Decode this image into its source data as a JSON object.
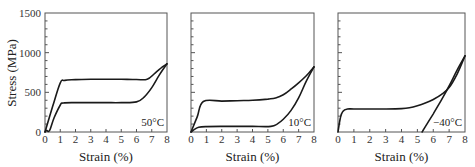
{
  "chart_data": [
    {
      "type": "line",
      "title": "",
      "annotation": "50°C",
      "xlabel": "Strain (%)",
      "ylabel": "Stress (MPa)",
      "xlim": [
        0,
        8
      ],
      "ylim": [
        0,
        1500
      ],
      "xticks": [
        0,
        1,
        2,
        3,
        4,
        5,
        6,
        7,
        8
      ],
      "yticks": [
        0,
        500,
        1000,
        1500
      ],
      "grid": false,
      "series": [
        {
          "name": "loading",
          "x": [
            0,
            0.5,
            1.0,
            1.3,
            2,
            3,
            4,
            5,
            6,
            6.7,
            7.2,
            7.7,
            8.0
          ],
          "y": [
            0,
            320,
            620,
            650,
            660,
            665,
            665,
            665,
            662,
            665,
            740,
            820,
            860
          ]
        },
        {
          "name": "unloading",
          "x": [
            8.0,
            7.5,
            7.0,
            6.5,
            6.0,
            5,
            4,
            3,
            2,
            1.2,
            1.0,
            0.6,
            0.3,
            0.1,
            0
          ],
          "y": [
            860,
            720,
            560,
            440,
            380,
            370,
            370,
            370,
            370,
            365,
            340,
            180,
            20,
            20,
            0
          ]
        }
      ]
    },
    {
      "type": "line",
      "title": "",
      "annotation": "10°C",
      "xlabel": "Strain (%)",
      "ylabel": "",
      "xlim": [
        0,
        8
      ],
      "ylim": [
        0,
        1500
      ],
      "xticks": [
        0,
        1,
        2,
        3,
        4,
        5,
        6,
        7,
        8
      ],
      "yticks": [
        0,
        500,
        1000,
        1500
      ],
      "grid": false,
      "series": [
        {
          "name": "loading",
          "x": [
            0,
            0.4,
            0.8,
            2,
            3,
            4,
            5,
            5.5,
            6,
            6.5,
            7,
            7.5,
            8.0
          ],
          "y": [
            0,
            190,
            385,
            390,
            395,
            400,
            415,
            430,
            470,
            540,
            620,
            710,
            820
          ]
        },
        {
          "name": "unloading",
          "x": [
            8.0,
            7.5,
            7.0,
            6.5,
            6.0,
            5.6,
            5.2,
            4,
            3,
            2,
            1,
            0.5,
            0.2,
            0
          ],
          "y": [
            820,
            640,
            430,
            270,
            160,
            100,
            70,
            70,
            70,
            70,
            68,
            60,
            30,
            0
          ]
        }
      ]
    },
    {
      "type": "line",
      "title": "",
      "annotation": "−40°C",
      "xlabel": "Strain (%)",
      "ylabel": "",
      "xlim": [
        0,
        8
      ],
      "ylim": [
        0,
        1500
      ],
      "xticks": [
        0,
        1,
        2,
        3,
        4,
        5,
        6,
        7,
        8
      ],
      "yticks": [
        0,
        500,
        1000,
        1500
      ],
      "grid": false,
      "series": [
        {
          "name": "loading",
          "x": [
            0,
            0.15,
            0.3,
            0.6,
            1,
            2,
            3,
            4,
            4.5,
            5,
            5.5,
            6,
            6.5,
            7,
            7.5,
            8.0
          ],
          "y": [
            0,
            180,
            260,
            290,
            290,
            290,
            290,
            295,
            305,
            330,
            365,
            410,
            470,
            560,
            730,
            960
          ]
        },
        {
          "name": "unloading",
          "x": [
            8.0,
            7.5,
            7.0,
            6.5,
            6.0,
            5.6,
            5.3
          ],
          "y": [
            960,
            780,
            580,
            400,
            230,
            100,
            0
          ]
        }
      ]
    }
  ],
  "figure": {
    "ylabel": "Stress (MPa)",
    "panels": [
      {
        "xlabel": "Strain (%)",
        "annotation": "50°C"
      },
      {
        "xlabel": "Strain (%)",
        "annotation": "10°C"
      },
      {
        "xlabel": "Strain (%)",
        "annotation": "−40°C"
      }
    ],
    "ytick_labels": [
      "0",
      "500",
      "1000",
      "1500"
    ],
    "xtick_labels": [
      "0",
      "1",
      "2",
      "3",
      "4",
      "5",
      "6",
      "7",
      "8"
    ],
    "colors": {
      "curve": "#1a1a1a",
      "frame": "#555555",
      "background": "#ffffff"
    }
  }
}
